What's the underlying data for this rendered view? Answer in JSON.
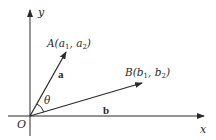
{
  "diagram": {
    "type": "vector-angle-diagram",
    "axes": {
      "x_label": "x",
      "y_label": "y",
      "origin_label": "O"
    },
    "points": {
      "A": {
        "name": "A",
        "coords": [
          "a",
          "1",
          "a",
          "2"
        ],
        "text": "A(a₁, a₂)"
      },
      "B": {
        "name": "B",
        "coords": [
          "b",
          "1",
          "b",
          "2"
        ],
        "text": "B(b₁, b₂)"
      }
    },
    "vectors": [
      {
        "id": "a",
        "label": "a",
        "from": "O",
        "to": "A"
      },
      {
        "id": "b",
        "label": "b",
        "from": "O",
        "to": "B"
      }
    ],
    "angle": {
      "label": "θ",
      "between": [
        "a",
        "b"
      ]
    },
    "colors": {
      "line": "#2a2a2a",
      "background": "#ffffff"
    }
  }
}
